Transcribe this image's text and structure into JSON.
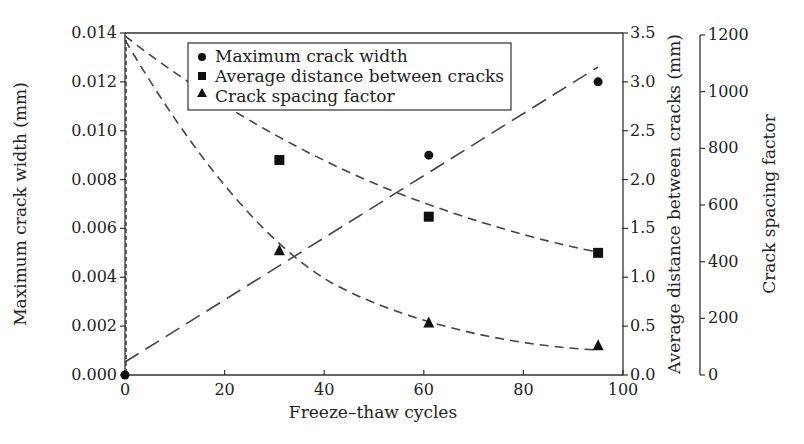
{
  "chart_data": {
    "type": "scatter",
    "title": "",
    "xlabel": "Freeze–thaw cycles",
    "x_ticks": [
      "0",
      "20",
      "40",
      "60",
      "80",
      "100"
    ],
    "xlim": [
      0,
      100
    ],
    "axes": {
      "left": {
        "label": "Maximum crack width (mm)",
        "ticks": [
          "0.000",
          "0.002",
          "0.004",
          "0.006",
          "0.008",
          "0.010",
          "0.012",
          "0.014"
        ],
        "ylim": [
          0,
          0.014
        ]
      },
      "middle_right": {
        "label": "Average distance between cracks (mm)",
        "ticks": [
          "0.0",
          "0.5",
          "1.0",
          "1.5",
          "2.0",
          "2.5",
          "3.0",
          "3.5"
        ],
        "ylim": [
          0,
          3.5
        ]
      },
      "far_right": {
        "label": "Crack spacing factor",
        "ticks": [
          "0",
          "200",
          "400",
          "600",
          "800",
          "1000",
          "1200"
        ],
        "ylim": [
          0,
          1200
        ]
      }
    },
    "legend": {
      "position": "upper center inside plot",
      "entries": [
        {
          "marker": "circle",
          "label": "Maximum crack width"
        },
        {
          "marker": "square",
          "label": "Average distance between cracks"
        },
        {
          "marker": "triangle",
          "label": "Crack spacing factor"
        }
      ]
    },
    "series": [
      {
        "name": "Maximum crack width",
        "axis": "left",
        "marker": "circle",
        "x": [
          0,
          61,
          95
        ],
        "values": [
          0.0,
          0.009,
          0.012
        ],
        "fit": "linear dashed, from ~0.0005 at 0 to ~0.0126 at 95"
      },
      {
        "name": "Average distance between cracks",
        "axis": "middle_right",
        "marker": "square",
        "x": [
          31,
          61,
          95
        ],
        "values": [
          2.2,
          1.62,
          1.25
        ],
        "fit": "decaying dashed curve starting ~2.88 at 0"
      },
      {
        "name": "Crack spacing factor",
        "axis": "far_right",
        "marker": "triangle",
        "x": [
          31,
          61,
          95
        ],
        "values": [
          440,
          185,
          105
        ],
        "fit": "exponential decay dashed curve starting ~970 at 0"
      }
    ],
    "grid": false
  }
}
